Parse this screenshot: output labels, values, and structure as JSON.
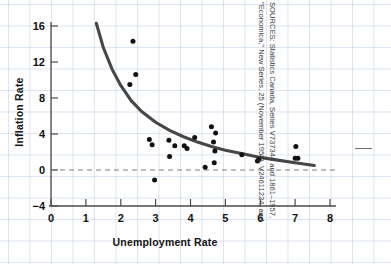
{
  "figure": {
    "source_note": "SOURCES: Statistics Canada, Series V737344 and V24611224, and \"Economica,\" New Series, 25 (November 1958).",
    "source_note_line1": "SOURCES: Statistics Canada, Series V737344 and 1861–1957,",
    "source_note_line2": "\"Economica,\" New Series, 25 (November 1958). V24611224, and"
  },
  "chart_data": {
    "type": "scatter",
    "title": "",
    "xlabel": "Unemployment Rate",
    "ylabel": "Inflation Rate",
    "xlim": [
      0,
      8.4
    ],
    "ylim": [
      -4,
      17
    ],
    "xticks": [
      0,
      1,
      2,
      3,
      4,
      5,
      6,
      7,
      8
    ],
    "xticklabels": [
      "0",
      "1",
      "2",
      "3",
      "4",
      "5",
      "6",
      "7",
      "8"
    ],
    "yticks": [
      -4,
      0,
      4,
      8,
      12,
      16
    ],
    "yticklabels": [
      "−4",
      "0",
      "4",
      "8",
      "12",
      "16"
    ],
    "grid": true,
    "grid_color": "#8caad2",
    "legend": "none",
    "series": [
      {
        "name": "Observations",
        "type": "scatter",
        "marker": "circle",
        "color": "#111111",
        "points": [
          [
            2.35,
            14.3
          ],
          [
            2.43,
            10.6
          ],
          [
            2.26,
            9.5
          ],
          [
            2.82,
            3.4
          ],
          [
            2.9,
            2.8
          ],
          [
            2.97,
            -1.1
          ],
          [
            3.38,
            3.3
          ],
          [
            3.4,
            1.5
          ],
          [
            3.55,
            2.7
          ],
          [
            3.82,
            2.7
          ],
          [
            3.9,
            2.4
          ],
          [
            4.12,
            3.6
          ],
          [
            4.42,
            0.3
          ],
          [
            4.6,
            4.8
          ],
          [
            4.66,
            3.1
          ],
          [
            4.68,
            0.8
          ],
          [
            4.72,
            4.1
          ],
          [
            4.7,
            2.1
          ],
          [
            5.47,
            1.7
          ],
          [
            5.92,
            1.0
          ],
          [
            5.96,
            1.2
          ],
          [
            7.02,
            2.6
          ],
          [
            7.0,
            1.3
          ],
          [
            7.08,
            1.3
          ]
        ]
      },
      {
        "name": "Fitted Phillips curve",
        "type": "line",
        "color": "#474747",
        "x_start": 1.3,
        "x_end": 7.55,
        "curve_points": [
          [
            1.3,
            16.3
          ],
          [
            1.5,
            13.6
          ],
          [
            1.75,
            11.2
          ],
          [
            2.0,
            9.4
          ],
          [
            2.3,
            7.7
          ],
          [
            2.6,
            6.5
          ],
          [
            3.0,
            5.3
          ],
          [
            3.4,
            4.4
          ],
          [
            3.8,
            3.7
          ],
          [
            4.2,
            3.1
          ],
          [
            4.6,
            2.6
          ],
          [
            5.0,
            2.2
          ],
          [
            5.5,
            1.8
          ],
          [
            6.0,
            1.4
          ],
          [
            6.5,
            1.1
          ],
          [
            7.0,
            0.8
          ],
          [
            7.55,
            0.5
          ]
        ]
      },
      {
        "name": "Zero inflation reference",
        "type": "hline",
        "value": 0,
        "style": "dashed",
        "color": "#7d7d7d"
      }
    ]
  }
}
